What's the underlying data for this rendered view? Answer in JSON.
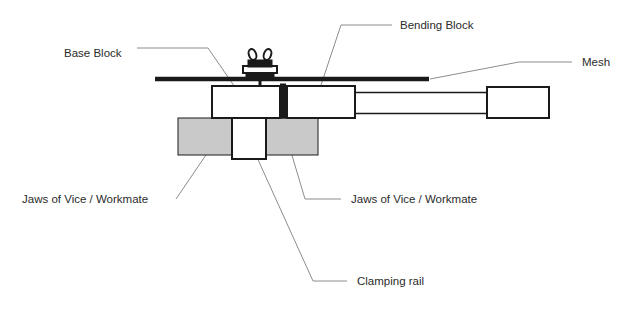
{
  "diagram": {
    "background_color": "#ffffff",
    "ink_color": "#1a1a1a",
    "leader_color": "#8c8c8c",
    "jaw_fill_color": "#c9c9c9",
    "part_fill_color": "#ffffff",
    "labels": {
      "base_block": "Base Block",
      "bending_block": "Bending Block",
      "mesh": "Mesh",
      "jaws_left": "Jaws of Vice / Workmate",
      "jaws_right": "Jaws of Vice / Workmate",
      "clamping_rail": "Clamping rail"
    },
    "parts": {
      "wing_nut": "wing-nut",
      "washer_stack": "washer-stack",
      "pivot_bar": "pivot-bar",
      "handle_rails": "handle-rails",
      "handle_end_block": "handle-end-block",
      "mesh_sheet": "mesh-sheet"
    }
  }
}
